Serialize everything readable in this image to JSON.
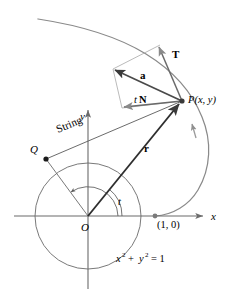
{
  "figure": {
    "name": "involute-of-circle-diagram",
    "colors": {
      "background": "#ffffff",
      "axis": "#6b6b6b",
      "circle": "#5a5a5a",
      "involute": "#7a7a7a",
      "vector": "#3a3a3a",
      "parallelogram": "#9a9a9a",
      "text": "#000000"
    }
  },
  "axes": {
    "x_label": "x",
    "y_label": "y",
    "origin_label": "O"
  },
  "points": {
    "origin": {
      "label": "O",
      "x": 88,
      "y": 216
    },
    "unit_point": {
      "label": "(1, 0)",
      "x": 155,
      "y": 216
    },
    "tangency": {
      "label": "Q",
      "x": 46,
      "y": 159
    },
    "curve_point": {
      "label": "P(x, y)",
      "x": 182,
      "y": 101
    }
  },
  "vectors": {
    "position": {
      "label": "r",
      "bold": true
    },
    "tangent": {
      "label": "T",
      "bold": true
    },
    "acceleration": {
      "label": "a",
      "bold": true
    },
    "normal_scaled": {
      "label_italic": "t",
      "label_bold": "N"
    }
  },
  "annotations": {
    "string": "String",
    "angle": "t",
    "circle_equation_x": "x",
    "circle_equation_sup": "2",
    "circle_equation_plus": "+",
    "circle_equation_y": "y",
    "circle_equation_eq": "= 1",
    "circle_equation_full": "x2 + y2 = 1"
  }
}
